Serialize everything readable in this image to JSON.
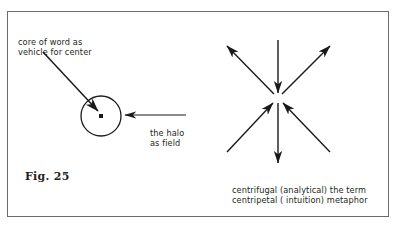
{
  "figure": {
    "id": "fig-25",
    "caption_label": "Fig. 25",
    "background_color": "#ffffff",
    "ink_color": "#231f20",
    "frame_color": "#6b6b6b",
    "frame": {
      "x": 7,
      "y": 11,
      "width": 382,
      "height": 206
    }
  },
  "annotations": {
    "core_label": "core of word as\nvehicle for center",
    "halo_label": "the halo\nas field",
    "caption_text": "centrifugal (analytical) the term\ncentripetal ( intuition) metaphor"
  },
  "left_diagram": {
    "name": "word-core-and-halo",
    "circle": {
      "cx": 101,
      "cy": 116,
      "r": 20
    },
    "center_dot": {
      "cx": 101,
      "cy": 116,
      "size": 4
    },
    "pointer_from_core_label": {
      "x1": 43,
      "y1": 52,
      "x2": 98,
      "y2": 111
    },
    "pointer_from_halo_label": {
      "x1": 186,
      "y1": 115,
      "x2": 124,
      "y2": 115
    }
  },
  "right_diagram": {
    "name": "centrifugal-centripetal-star",
    "center": {
      "cx": 278,
      "cy": 98
    },
    "arrows": [
      {
        "id": "arrow-north-inward",
        "direction": "down",
        "flow": "centripetal",
        "x1": 278,
        "y1": 40,
        "x2": 278,
        "y2": 93
      },
      {
        "id": "arrow-northeast-outward",
        "direction": "up-right",
        "flow": "centrifugal",
        "x1": 282,
        "y1": 94,
        "x2": 330,
        "y2": 46
      },
      {
        "id": "arrow-northwest-outward",
        "direction": "up-left",
        "flow": "centrifugal",
        "x1": 274,
        "y1": 94,
        "x2": 227,
        "y2": 46
      },
      {
        "id": "arrow-southeast-inward",
        "direction": "up-left",
        "flow": "centripetal",
        "x1": 330,
        "y1": 152,
        "x2": 283,
        "y2": 103
      },
      {
        "id": "arrow-southwest-inward",
        "direction": "up-right",
        "flow": "centripetal",
        "x1": 227,
        "y1": 152,
        "x2": 273,
        "y2": 103
      },
      {
        "id": "arrow-south-outward",
        "direction": "down",
        "flow": "centrifugal",
        "x1": 278,
        "y1": 103,
        "x2": 278,
        "y2": 163
      }
    ]
  }
}
